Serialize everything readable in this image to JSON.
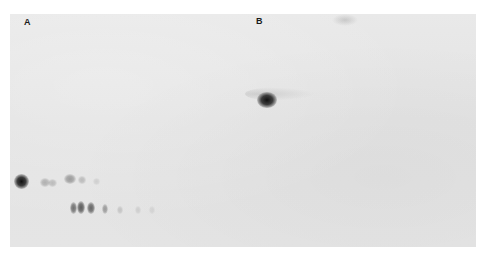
{
  "figure": {
    "type": "autoradiograph",
    "background_color": "#e6e6e6",
    "spot_color": "#111111",
    "panels": [
      {
        "id": "A",
        "label": "A",
        "spots": [
          {
            "name": "origin-spot",
            "intensity": 1.0
          },
          {
            "name": "faint-spot-1",
            "intensity": 0.25
          },
          {
            "name": "faint-spot-2",
            "intensity": 0.2
          },
          {
            "name": "upper-band-1",
            "intensity": 0.35
          },
          {
            "name": "upper-band-2",
            "intensity": 0.2
          },
          {
            "name": "upper-band-3",
            "intensity": 0.1
          },
          {
            "name": "lower-band-1",
            "intensity": 0.55
          },
          {
            "name": "lower-band-2",
            "intensity": 0.65
          },
          {
            "name": "lower-band-3",
            "intensity": 0.6
          },
          {
            "name": "lower-band-4",
            "intensity": 0.35
          },
          {
            "name": "lower-band-5",
            "intensity": 0.15
          },
          {
            "name": "lower-band-6",
            "intensity": 0.1
          },
          {
            "name": "lower-band-7",
            "intensity": 0.08
          }
        ]
      },
      {
        "id": "B",
        "label": "B",
        "spots": [
          {
            "name": "main-spot",
            "intensity": 1.0
          },
          {
            "name": "tail-streak",
            "intensity": 0.15
          },
          {
            "name": "top-smudge",
            "intensity": 0.2
          }
        ]
      }
    ]
  }
}
